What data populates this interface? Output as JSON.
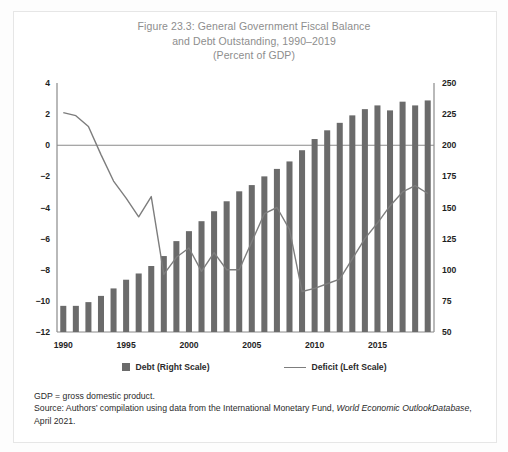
{
  "figure": {
    "title_line1": "Figure 23.3: General Government Fiscal Balance",
    "title_line2": "and Debt Outstanding, 1990–2019",
    "title_line3": "(Percent of GDP)"
  },
  "legend": {
    "debt_label": "Debt (Right Scale)",
    "deficit_label": "Deficit (Left Scale)"
  },
  "notes": {
    "line1": "GDP = gross domestic product.",
    "line2_a": "Source: Authors’ compilation using data from the International Monetary Fund, ",
    "line2_i": "World Economic Outlook",
    "line3_i": "Database",
    "line3_b": ", April 2021."
  },
  "colors": {
    "bar": "#6b6b6b",
    "line": "#7d7d7d",
    "axis": "#8a8a8a",
    "title": "#8d8d8d",
    "text": "#1f1f1f"
  },
  "chart_data": {
    "type": "bar",
    "title": "Figure 23.3: General Government Fiscal Balance and Debt Outstanding, 1990–2019 (Percent of GDP)",
    "xlabel": "",
    "ylabel_left": "Deficit (Percent of GDP)",
    "ylabel_right": "Debt (Percent of GDP)",
    "grid": false,
    "legend_position": "bottom",
    "categories": [
      1990,
      1991,
      1992,
      1993,
      1994,
      1995,
      1996,
      1997,
      1998,
      1999,
      2000,
      2001,
      2002,
      2003,
      2004,
      2005,
      2006,
      2007,
      2008,
      2009,
      2010,
      2011,
      2012,
      2013,
      2014,
      2015,
      2016,
      2017,
      2018,
      2019
    ],
    "xticks": [
      1990,
      1995,
      2000,
      2005,
      2010,
      2015
    ],
    "ylim_left": [
      -12,
      4
    ],
    "yticks_left": [
      4,
      2,
      0,
      -2,
      -4,
      -6,
      -8,
      -10,
      -12
    ],
    "ylim_right": [
      50,
      250
    ],
    "yticks_right": [
      250,
      225,
      200,
      175,
      150,
      125,
      100,
      75,
      50
    ],
    "series": [
      {
        "name": "Debt (Right Scale)",
        "type": "bar",
        "axis": "right",
        "values": [
          71,
          71,
          74,
          79,
          85,
          92,
          97,
          103,
          111,
          123,
          131,
          139,
          147,
          155,
          163,
          168,
          175,
          181,
          187,
          196,
          205,
          212,
          218,
          224,
          229,
          232,
          228,
          235,
          232,
          236
        ]
      },
      {
        "name": "Deficit (Left Scale)",
        "type": "line",
        "axis": "left",
        "values": [
          2.1,
          1.9,
          1.2,
          -0.6,
          -2.3,
          -3.4,
          -4.6,
          -3.3,
          -8.3,
          -7.2,
          -6.6,
          -8.1,
          -6.9,
          -8.0,
          -8.0,
          -6.2,
          -4.4,
          -4.0,
          -5.4,
          -9.4,
          -9.2,
          -8.9,
          -8.6,
          -7.3,
          -6.0,
          -5.0,
          -3.9,
          -3.0,
          -2.6,
          -3.1
        ]
      }
    ]
  }
}
